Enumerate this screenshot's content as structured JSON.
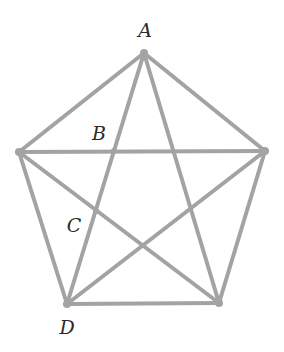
{
  "diagram": {
    "type": "geometry",
    "colors": {
      "line": "#a3a3a3",
      "label": "#2a2a2a",
      "background": "#ffffff"
    },
    "vertices": {
      "top": {
        "x": 144,
        "y": 53
      },
      "right": {
        "x": 265,
        "y": 151
      },
      "bottom_right": {
        "x": 219,
        "y": 303
      },
      "bottom_left": {
        "x": 67,
        "y": 304
      },
      "left": {
        "x": 19,
        "y": 152
      }
    },
    "points": {
      "B": {
        "x": 114,
        "y": 151
      },
      "C": {
        "x": 96,
        "y": 211
      }
    },
    "labels": [
      {
        "id": "A",
        "text": "A",
        "x": 145,
        "y": 37
      },
      {
        "id": "B",
        "text": "B",
        "x": 99,
        "y": 140
      },
      {
        "id": "C",
        "text": "C",
        "x": 74,
        "y": 232
      },
      {
        "id": "D",
        "text": "D",
        "x": 67,
        "y": 334
      }
    ]
  }
}
